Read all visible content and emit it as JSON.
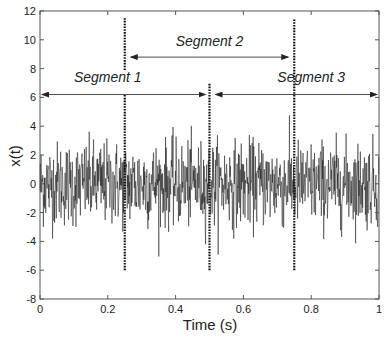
{
  "chart_data": {
    "type": "line",
    "title": "",
    "xlabel": "Time (s)",
    "ylabel": "x(t)",
    "xlim": [
      0,
      1
    ],
    "ylim": [
      -8,
      12
    ],
    "xticks": [
      0,
      0.2,
      0.4,
      0.6,
      0.8,
      1
    ],
    "xtick_labels": [
      "0",
      "0.2",
      "0.4",
      "0.6",
      "0.8",
      "1"
    ],
    "yticks": [
      -8,
      -6,
      -4,
      -2,
      0,
      2,
      4,
      6,
      8,
      10,
      12
    ],
    "ytick_labels": [
      "-8",
      "-6",
      "-4",
      "-2",
      "0",
      "2",
      "4",
      "6",
      "8",
      "10",
      "12"
    ],
    "grid": false,
    "legend": null,
    "series": [
      {
        "name": "x(t)",
        "description": "random noise signal, mean ~0, peaks approx +5.8 / -5.2",
        "n_points": 1000,
        "approx_range": [
          -5.2,
          5.8
        ],
        "color": "#1a1a1a"
      }
    ],
    "annotations": {
      "boundaries": [
        {
          "x": 0.25,
          "y_from": -6,
          "y_to": 11.5,
          "gap_y": [
            6.2,
            7.9
          ],
          "style": "dotted"
        },
        {
          "x": 0.5,
          "y_from": -6,
          "y_to": 7,
          "style": "dotted"
        },
        {
          "x": 0.75,
          "y_from": -6,
          "y_to": 11.5,
          "style": "dotted"
        }
      ],
      "segments": [
        {
          "label": "Segment 1",
          "x_start": 0,
          "x_end": 0.5,
          "arrow_y": 6.2,
          "label_x": 0.2,
          "label_y": 7.4
        },
        {
          "label": "Segment 2",
          "x_start": 0.25,
          "x_end": 0.75,
          "arrow_y": 8.8,
          "label_x": 0.5,
          "label_y": 9.9
        },
        {
          "label": "Segment 3",
          "x_start": 0.5,
          "x_end": 1,
          "arrow_y": 6.2,
          "label_x": 0.8,
          "label_y": 7.4
        }
      ]
    }
  },
  "labels": {
    "xlabel": "Time (s)",
    "ylabel": "x(t)",
    "segment1": "Segment 1",
    "segment2": "Segment 2",
    "segment3": "Segment 3"
  }
}
